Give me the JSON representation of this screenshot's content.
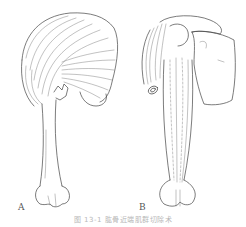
{
  "figure": {
    "panels": [
      {
        "label": "A",
        "description": "Anterior view of humerus with shoulder girdle muscles (deltoid, pectoralis) fanning over proximal humerus"
      },
      {
        "label": "B",
        "description": "Anterior view of scapula and humerus with biceps/brachialis muscles along shaft, detached tendon end"
      }
    ],
    "caption": "图 13-1  肱骨近端肌群切除术"
  }
}
